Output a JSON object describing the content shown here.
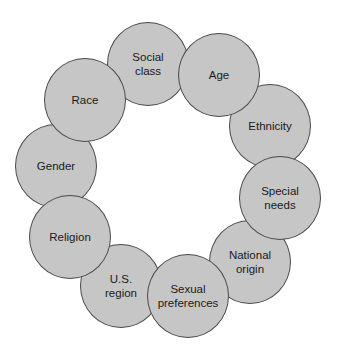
{
  "diagram": {
    "type": "ring-of-circles",
    "title": "",
    "fill_color": "#c6c6c6",
    "border_color": "#4a4a4a",
    "background": "#ffffff",
    "nodes": [
      {
        "id": "social-class",
        "label": "Social\nclass",
        "cx": 148,
        "cy": 64,
        "r": 42,
        "z": 1
      },
      {
        "id": "age",
        "label": "Age",
        "cx": 219,
        "cy": 75,
        "r": 42,
        "z": 2
      },
      {
        "id": "ethnicity",
        "label": "Ethnicity",
        "cx": 270,
        "cy": 126,
        "r": 42,
        "z": 1
      },
      {
        "id": "special-needs",
        "label": "Special\nneeds",
        "cx": 280,
        "cy": 198,
        "r": 42,
        "z": 2
      },
      {
        "id": "national-origin",
        "label": "National\norigin",
        "cx": 250,
        "cy": 262,
        "r": 42,
        "z": 1
      },
      {
        "id": "sexual-preferences",
        "label": "Sexual\npreferences",
        "cx": 188,
        "cy": 296,
        "r": 42,
        "z": 2
      },
      {
        "id": "us-region",
        "label": "U.S.\nregion",
        "cx": 121,
        "cy": 286,
        "r": 42,
        "z": 1
      },
      {
        "id": "religion",
        "label": "Religion",
        "cx": 70,
        "cy": 237,
        "r": 42,
        "z": 2
      },
      {
        "id": "gender",
        "label": "Gender",
        "cx": 56,
        "cy": 166,
        "r": 42,
        "z": 1
      },
      {
        "id": "race",
        "label": "Race",
        "cx": 85,
        "cy": 100,
        "r": 42,
        "z": 2
      }
    ]
  }
}
